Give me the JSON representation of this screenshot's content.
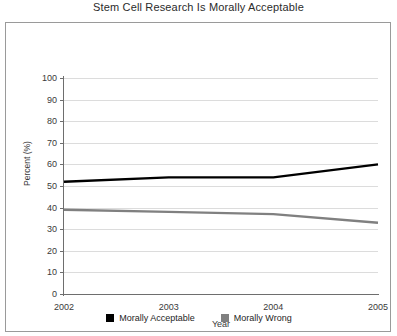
{
  "chart_data": {
    "type": "line",
    "title": "Stem Cell Research Is Morally Acceptable",
    "xlabel": "Year",
    "ylabel": "Percent (%)",
    "categories": [
      "2002",
      "2003",
      "2004",
      "2005"
    ],
    "x": [
      2002,
      2003,
      2004,
      2005
    ],
    "series": [
      {
        "name": "Morally Acceptable",
        "color": "#000000",
        "values": [
          52,
          54,
          54,
          60
        ]
      },
      {
        "name": "Morally Wrong",
        "color": "#808080",
        "values": [
          39,
          38,
          37,
          33
        ]
      }
    ],
    "ylim": [
      0,
      100
    ],
    "ytick_labels": [
      "100",
      "90",
      "80",
      "70",
      "60",
      "50",
      "40",
      "30",
      "20",
      "10",
      "0"
    ],
    "ytick_values": [
      100,
      90,
      80,
      70,
      60,
      50,
      40,
      30,
      20,
      10,
      0
    ],
    "xlim": [
      2002,
      2005
    ],
    "grid": "horizontal",
    "legend_position": "bottom-center"
  },
  "legend": {
    "entries": [
      {
        "label": "Morally Acceptable",
        "color": "#000000"
      },
      {
        "label": "Morally Wrong",
        "color": "#808080"
      }
    ]
  },
  "colors": {
    "frame_border": "#9a9a9a",
    "axis": "#6e6e6e",
    "gridline": "#dcdcdc",
    "background": "#ffffff",
    "text": "#2b2b2b"
  }
}
